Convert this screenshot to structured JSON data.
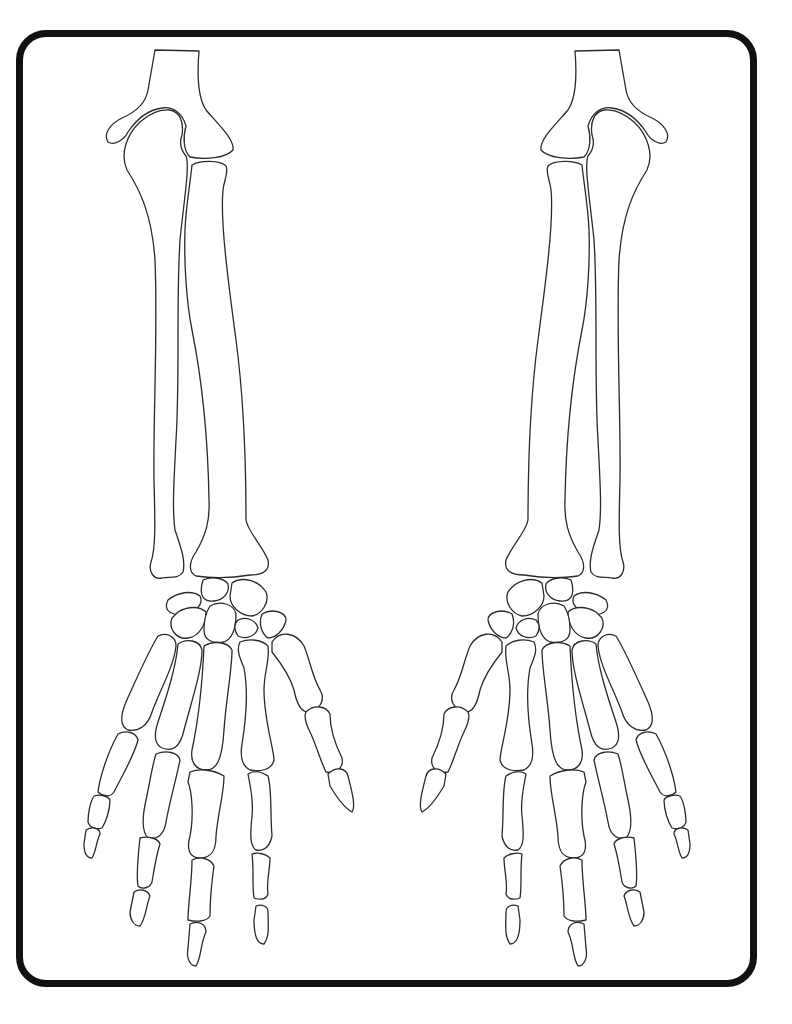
{
  "page": {
    "type": "coloring-page",
    "line_color": "#2a2a2a",
    "frame_color": "#111111",
    "background": "#ffffff"
  },
  "figures": [
    {
      "id": "left-arm",
      "label": "Left forearm and hand skeleton",
      "bones": [
        "humerus-distal",
        "ulna",
        "radius",
        "carpals",
        "metacarpals",
        "phalanges"
      ]
    },
    {
      "id": "right-arm",
      "label": "Right forearm and hand skeleton (mirrored)",
      "bones": [
        "humerus-distal",
        "ulna",
        "radius",
        "carpals",
        "metacarpals",
        "phalanges"
      ]
    }
  ]
}
